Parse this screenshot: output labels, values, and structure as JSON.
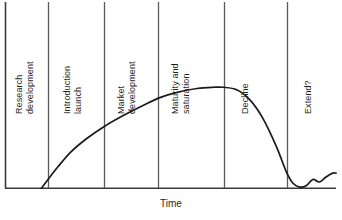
{
  "chart_data": {
    "type": "line",
    "title": "",
    "subtitle": "",
    "xlabel": "Time",
    "ylabel": "",
    "grid": false,
    "legend": "none",
    "axis_ranges": {
      "x": [
        0,
        100
      ],
      "y": [
        0,
        100
      ]
    },
    "annotations": [
      "Research development",
      "Introduction launch",
      "Market development",
      "Maturity and saturation",
      "Decline",
      "Extend?"
    ],
    "stages": [
      {
        "label_line1": "Research",
        "label_line2": "development",
        "x_start": 0,
        "x_end": 13
      },
      {
        "label_line1": "Introduction",
        "label_line2": "launch",
        "x_start": 13,
        "x_end": 30
      },
      {
        "label_line1": "Market",
        "label_line2": "development",
        "x_start": 30,
        "x_end": 46
      },
      {
        "label_line1": "Maturity and",
        "label_line2": "saturation",
        "x_start": 46,
        "x_end": 66
      },
      {
        "label_line1": "Decline",
        "label_line2": "",
        "x_start": 66,
        "x_end": 85
      },
      {
        "label_line1": "Extend?",
        "label_line2": "",
        "x_start": 85,
        "x_end": 100
      }
    ],
    "x": [
      11,
      13,
      16,
      20,
      25,
      30,
      36,
      42,
      47,
      52,
      58,
      63,
      66,
      70,
      74,
      78,
      82,
      85,
      87,
      89,
      91,
      93,
      95,
      97,
      99,
      100
    ],
    "values": [
      0,
      7,
      17,
      29,
      40,
      49,
      58,
      66,
      72,
      76,
      79,
      80,
      80,
      78,
      70,
      55,
      33,
      13,
      4,
      1,
      2,
      7,
      5,
      9,
      12,
      12
    ],
    "series": [
      {
        "name": "Sales",
        "values": [
          0,
          7,
          17,
          29,
          40,
          49,
          58,
          66,
          72,
          76,
          79,
          80,
          80,
          78,
          70,
          55,
          33,
          13,
          4,
          1,
          2,
          7,
          5,
          9,
          12,
          12
        ]
      }
    ],
    "curve_color": "#1a1a1a",
    "divider_color": "#5a5a5a",
    "axis_color": "#3a3a3a"
  },
  "axis": {
    "x_title": "Time"
  },
  "stage_labels": [
    "Research\ndevelopment",
    "Introduction\nlaunch",
    "Market\ndevelopment",
    "Maturity and\nsaturation",
    "Decline",
    "Extend?"
  ]
}
